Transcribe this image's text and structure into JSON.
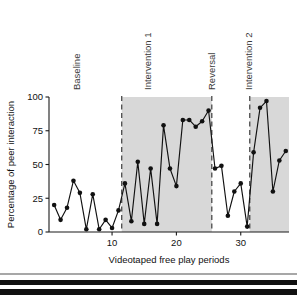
{
  "figure": {
    "width": 297,
    "height": 295,
    "background": "#ffffff"
  },
  "axis_titles": {
    "y": "Percentage of peer interaction",
    "x": "Videotaped free play periods"
  },
  "y_ticks": [
    "0",
    "25",
    "50",
    "75",
    "100"
  ],
  "x_ticks": [
    "10",
    "20",
    "30"
  ],
  "phase_labels": {
    "baseline": "Baseline",
    "intervention1": "Intervention 1",
    "reversal": "Reversal",
    "intervention2": "Intervention 2"
  },
  "colors": {
    "shade": "#d8d8d8",
    "line": "#111111",
    "point": "#111111",
    "divider": "#4a4a4a",
    "axis": "#1a1a1a",
    "text": "#111111",
    "phase_text": "#3a3a3a"
  },
  "chart_data": {
    "type": "line",
    "title": "",
    "subtitle": "",
    "xlabel": "Videotaped free play periods",
    "ylabel": "Percentage of peer interaction",
    "xlim": [
      0.2,
      37.5
    ],
    "ylim": [
      0,
      100
    ],
    "grid": false,
    "legend": "none",
    "x_tick_values": [
      10,
      20,
      30
    ],
    "y_tick_values": [
      0,
      25,
      50,
      75,
      100
    ],
    "x": [
      1,
      2,
      3,
      4,
      5,
      6,
      7,
      8,
      9,
      10,
      11,
      12,
      13,
      14,
      15,
      16,
      17,
      18,
      19,
      20,
      21,
      22,
      23,
      24,
      25,
      26,
      27,
      28,
      29,
      30,
      31,
      32,
      33,
      34,
      35,
      36,
      37
    ],
    "values": [
      20,
      9,
      18,
      38,
      29,
      2,
      28,
      2,
      9,
      3,
      16,
      36,
      8,
      52,
      6,
      47,
      6,
      79,
      47,
      34,
      83,
      83,
      78,
      82,
      90,
      47,
      49,
      12,
      30,
      36,
      4,
      59,
      92,
      97,
      30,
      53,
      60
    ],
    "series": [
      {
        "name": "Percentage of peer interaction",
        "values": [
          20,
          9,
          18,
          38,
          29,
          2,
          28,
          2,
          9,
          3,
          16,
          36,
          8,
          52,
          6,
          47,
          6,
          79,
          47,
          34,
          83,
          83,
          78,
          82,
          90,
          47,
          49,
          12,
          30,
          36,
          4,
          59,
          92,
          97,
          30,
          53,
          60
        ]
      }
    ],
    "phases": [
      {
        "name": "Baseline",
        "x_start": 0.2,
        "x_end": 11.5,
        "shaded": false
      },
      {
        "name": "Intervention 1",
        "x_start": 11.5,
        "x_end": 25.5,
        "shaded": true
      },
      {
        "name": "Reversal",
        "x_start": 25.5,
        "x_end": 31.4,
        "shaded": false
      },
      {
        "name": "Intervention 2",
        "x_start": 31.4,
        "x_end": 37.5,
        "shaded": true
      }
    ],
    "phase_dividers": [
      11.5,
      25.5,
      31.4
    ],
    "annotations": [
      {
        "text": "Baseline",
        "x": 5.0,
        "rotation": -90
      },
      {
        "text": "Intervention 1",
        "x": 16.0,
        "rotation": -90
      },
      {
        "text": "Reversal",
        "x": 26.0,
        "rotation": -90
      },
      {
        "text": "Intervention 2",
        "x": 31.8,
        "rotation": -90
      }
    ]
  }
}
